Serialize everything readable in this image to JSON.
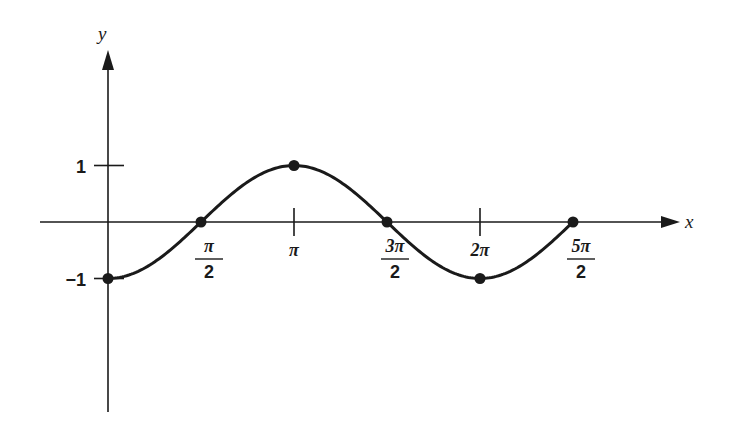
{
  "chart_data": {
    "type": "line",
    "title": "",
    "xlabel": "x",
    "ylabel": "y",
    "function": "y = -cos(x)",
    "xlim": [
      -1.05,
      4.05
    ],
    "ylim": [
      -2.55,
      2.65
    ],
    "x_unit": "pi",
    "x_ticks": [
      {
        "value": 0.5,
        "num": "π",
        "den": "2"
      },
      {
        "value": 1.0,
        "label": "π"
      },
      {
        "value": 1.5,
        "num": "3π",
        "den": "2"
      },
      {
        "value": 2.0,
        "label": "2π"
      },
      {
        "value": 2.5,
        "num": "5π",
        "den": "2"
      }
    ],
    "y_ticks": [
      {
        "value": 1,
        "label": "1"
      },
      {
        "value": -1,
        "label": "−1"
      }
    ],
    "curve_range_pi": [
      0,
      2.5
    ],
    "points": [
      {
        "x_pi": 0,
        "y": -1
      },
      {
        "x_pi": 0.5,
        "y": 0
      },
      {
        "x_pi": 1.0,
        "y": 1
      },
      {
        "x_pi": 1.5,
        "y": 0
      },
      {
        "x_pi": 2.0,
        "y": -1
      },
      {
        "x_pi": 2.5,
        "y": 0
      }
    ],
    "grid": false,
    "legend": "none",
    "color": "#1a1a1a"
  }
}
